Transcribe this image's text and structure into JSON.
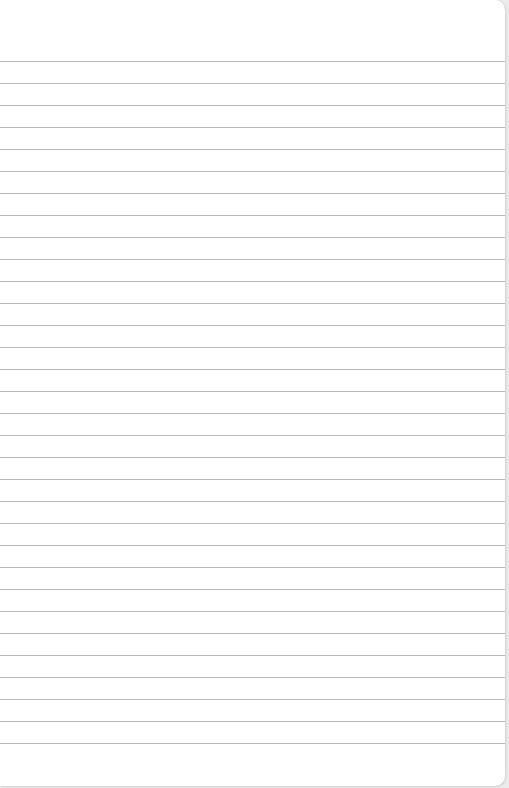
{
  "notepad": {
    "line_count": 32,
    "first_line_y": 61,
    "line_spacing": 22,
    "line_color": "#b9b9b9",
    "paper_color": "#ffffff",
    "text_lines": []
  }
}
